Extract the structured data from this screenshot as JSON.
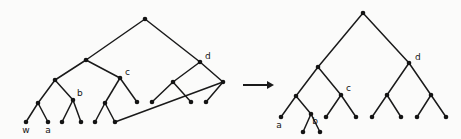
{
  "figure": {
    "background_color": "#fbfbfa",
    "stroke_color": "#1a1a1a",
    "node_color": "#141414",
    "label_color": "#141414",
    "node_radius": 2.3,
    "edge_width": 1.5,
    "transition_symbol": "arrow-right"
  },
  "labels": {
    "left_w": "w",
    "left_a": "a",
    "left_b": "b",
    "left_c": "c",
    "left_d": "d",
    "right_a": "a",
    "right_b": "b",
    "right_c": "c",
    "right_d": "d"
  },
  "arrow": {
    "x1": 243,
    "y1": 85,
    "x2": 274,
    "y2": 85,
    "name": "transforms-to"
  },
  "chart_data": {
    "type": "diagram",
    "panels": [
      {
        "name": "left-tree",
        "nodes": [
          {
            "id": "L0",
            "x": 145,
            "y": 19,
            "label": null
          },
          {
            "id": "L1",
            "x": 86,
            "y": 60,
            "label": null
          },
          {
            "id": "L2",
            "x": 200,
            "y": 62,
            "label": "d"
          },
          {
            "id": "L3",
            "x": 55,
            "y": 80,
            "label": null
          },
          {
            "id": "L4",
            "x": 120,
            "y": 78,
            "label": "c"
          },
          {
            "id": "L5",
            "x": 173,
            "y": 82,
            "label": null
          },
          {
            "id": "L6",
            "x": 223,
            "y": 82,
            "label": null
          },
          {
            "id": "L7",
            "x": 38,
            "y": 103,
            "label": null
          },
          {
            "id": "L8",
            "x": 73,
            "y": 100,
            "label": "b"
          },
          {
            "id": "L9",
            "x": 105,
            "y": 103,
            "label": null
          },
          {
            "id": "L10",
            "x": 137,
            "y": 102,
            "label": null
          },
          {
            "id": "L11",
            "x": 152,
            "y": 102,
            "label": null
          },
          {
            "id": "L12",
            "x": 191,
            "y": 102,
            "label": null
          },
          {
            "id": "L13",
            "x": 206,
            "y": 102,
            "label": null
          },
          {
            "id": "L14",
            "x": 26,
            "y": 122,
            "label": "w"
          },
          {
            "id": "L15",
            "x": 48,
            "y": 122,
            "label": "a"
          },
          {
            "id": "L16",
            "x": 62,
            "y": 122,
            "label": null
          },
          {
            "id": "L17",
            "x": 81,
            "y": 122,
            "label": null
          },
          {
            "id": "L18",
            "x": 95,
            "y": 122,
            "label": null
          },
          {
            "id": "L19",
            "x": 115,
            "y": 122,
            "label": null
          }
        ],
        "edges": [
          [
            "L0",
            "L1"
          ],
          [
            "L0",
            "L2"
          ],
          [
            "L1",
            "L3"
          ],
          [
            "L1",
            "L4"
          ],
          [
            "L2",
            "L5"
          ],
          [
            "L2",
            "L6"
          ],
          [
            "L3",
            "L7"
          ],
          [
            "L3",
            "L8"
          ],
          [
            "L4",
            "L9"
          ],
          [
            "L4",
            "L10"
          ],
          [
            "L5",
            "L11"
          ],
          [
            "L5",
            "L12"
          ],
          [
            "L6",
            "L13"
          ],
          [
            "L6",
            "L19"
          ],
          [
            "L7",
            "L14"
          ],
          [
            "L7",
            "L15"
          ],
          [
            "L8",
            "L16"
          ],
          [
            "L8",
            "L17"
          ],
          [
            "L9",
            "L18"
          ],
          [
            "L9",
            "L19"
          ]
        ]
      },
      {
        "name": "right-tree",
        "nodes": [
          {
            "id": "R0",
            "x": 363,
            "y": 13,
            "label": null
          },
          {
            "id": "R1",
            "x": 318,
            "y": 67,
            "label": null
          },
          {
            "id": "R2",
            "x": 409,
            "y": 63,
            "label": "d"
          },
          {
            "id": "R3",
            "x": 296,
            "y": 96,
            "label": null
          },
          {
            "id": "R4",
            "x": 341,
            "y": 95,
            "label": "c"
          },
          {
            "id": "R5",
            "x": 387,
            "y": 95,
            "label": null
          },
          {
            "id": "R6",
            "x": 431,
            "y": 95,
            "label": null
          },
          {
            "id": "R7",
            "x": 281,
            "y": 117,
            "label": "a"
          },
          {
            "id": "R8",
            "x": 311,
            "y": 114,
            "label": "b"
          },
          {
            "id": "R9",
            "x": 326,
            "y": 117,
            "label": null
          },
          {
            "id": "R10",
            "x": 356,
            "y": 117,
            "label": null
          },
          {
            "id": "R11",
            "x": 372,
            "y": 117,
            "label": null
          },
          {
            "id": "R12",
            "x": 401,
            "y": 117,
            "label": null
          },
          {
            "id": "R13",
            "x": 417,
            "y": 117,
            "label": null
          },
          {
            "id": "R14",
            "x": 446,
            "y": 117,
            "label": null
          },
          {
            "id": "R15",
            "x": 303,
            "y": 132,
            "label": null
          },
          {
            "id": "R16",
            "x": 320,
            "y": 132,
            "label": null
          }
        ],
        "edges": [
          [
            "R0",
            "R1"
          ],
          [
            "R0",
            "R2"
          ],
          [
            "R1",
            "R3"
          ],
          [
            "R1",
            "R4"
          ],
          [
            "R2",
            "R5"
          ],
          [
            "R2",
            "R6"
          ],
          [
            "R3",
            "R7"
          ],
          [
            "R3",
            "R8"
          ],
          [
            "R4",
            "R9"
          ],
          [
            "R4",
            "R10"
          ],
          [
            "R5",
            "R11"
          ],
          [
            "R5",
            "R12"
          ],
          [
            "R6",
            "R13"
          ],
          [
            "R6",
            "R14"
          ],
          [
            "R8",
            "R15"
          ],
          [
            "R8",
            "R16"
          ]
        ]
      }
    ],
    "label_offsets": {
      "L2": {
        "dx": 5,
        "dy": -3
      },
      "L4": {
        "dx": 5,
        "dy": -3
      },
      "L8": {
        "dx": 4,
        "dy": -4
      },
      "L14": {
        "dx": 0,
        "dy": 11
      },
      "L15": {
        "dx": 0,
        "dy": 11
      },
      "R2": {
        "dx": 6,
        "dy": -3
      },
      "R4": {
        "dx": 5,
        "dy": -4
      },
      "R7": {
        "dx": -2,
        "dy": 11
      },
      "R8": {
        "dx": 4,
        "dy": 10
      }
    }
  }
}
